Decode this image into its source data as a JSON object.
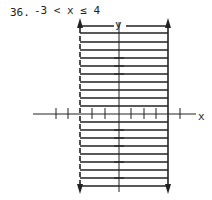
{
  "problem": {
    "number": "36.",
    "inequality": "-3 < x ≤ 4"
  },
  "graph": {
    "x_label": "x",
    "y_label": "y",
    "left_boundary": {
      "x": -3,
      "style": "dashed"
    },
    "right_boundary": {
      "x": 4,
      "style": "solid"
    },
    "shading": "vertical strip between boundaries",
    "colors": {
      "ink": "#222222",
      "background": "#ffffff"
    }
  }
}
